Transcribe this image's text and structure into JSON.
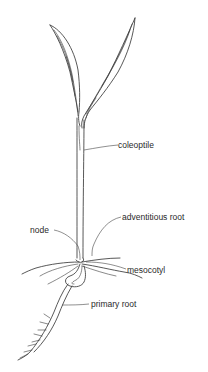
{
  "figure": {
    "labels": {
      "coleoptile": "coleoptile",
      "adventitious_root": "adventitious root",
      "node": "node",
      "mesocotyl": "mesocotyl",
      "primary_root": "primary root"
    }
  },
  "colors": {
    "background": "#ffffff",
    "ink": "#3a3a3a"
  }
}
